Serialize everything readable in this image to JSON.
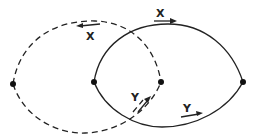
{
  "diagram": {
    "title": "",
    "colors": {
      "stroke": "#222222",
      "background": "#ffffff"
    },
    "nodes": [
      {
        "id": "n1",
        "x": 13,
        "y": 84
      },
      {
        "id": "n2",
        "x": 94,
        "y": 82
      },
      {
        "id": "n3",
        "x": 161,
        "y": 82
      },
      {
        "id": "n4",
        "x": 243,
        "y": 82
      }
    ],
    "loops": [
      {
        "id": "dashed-loop",
        "style": "dashed",
        "from": "n1",
        "to": "n3"
      },
      {
        "id": "solid-loop",
        "style": "solid",
        "from": "n2",
        "to": "n4"
      }
    ],
    "labels": {
      "x_dashed_top": "X",
      "x_solid_top": "X",
      "y_dashed_bottom": "Y",
      "y_solid_bottom": "Y"
    }
  }
}
